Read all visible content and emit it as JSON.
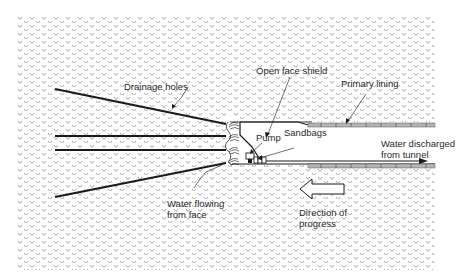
{
  "diagram": {
    "labels": {
      "drainage_holes": "Drainage holes",
      "open_face_shield": "Open face shield",
      "primary_lining": "Primary lining",
      "pump": "Pump",
      "sandbags": "Sandbags",
      "water_discharged_1": "Water discharged",
      "water_discharged_2": "from tunnel",
      "water_flowing_1": "Water flowing",
      "water_flowing_2": "from face",
      "direction_1": "Direction of",
      "direction_2": "progress"
    },
    "elements": [
      "ground-hatching",
      "drainage-hole-lines",
      "tunnel-face",
      "open-face-shield",
      "primary-lining-upper",
      "primary-lining-lower",
      "pump",
      "sandbags",
      "discharge-pipe",
      "water-flow-symbols",
      "progress-arrow"
    ],
    "colors": {
      "hatch": "#8a8a8a",
      "line": "#1a1a1a",
      "lining_fill": "#b5b5b5",
      "text": "#2a2a2a"
    }
  }
}
